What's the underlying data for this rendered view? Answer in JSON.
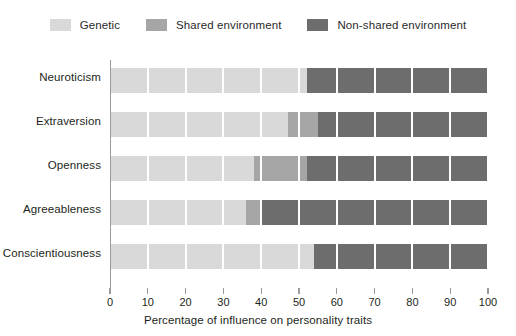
{
  "chart_data": {
    "type": "bar",
    "orientation": "horizontal",
    "stacked": true,
    "title": "",
    "subtitle": "",
    "xlabel": "Percentage of influence on personality traits",
    "ylabel": "",
    "xlim": [
      0,
      100
    ],
    "xticks": [
      0,
      10,
      20,
      30,
      40,
      50,
      60,
      70,
      80,
      90,
      100
    ],
    "xticklabels": [
      "0",
      "10",
      "20",
      "30",
      "40",
      "50",
      "60",
      "70",
      "80",
      "90",
      "100"
    ],
    "grid": "vertical-white-overlay",
    "legend_position": "top-center",
    "categories": [
      "Neuroticism",
      "Extraversion",
      "Openness",
      "Agreeableness",
      "Conscientiousness"
    ],
    "series": [
      {
        "name": "Genetic",
        "color": "#d9d9d9",
        "values": [
          52,
          47,
          38,
          36,
          54
        ]
      },
      {
        "name": "Shared environment",
        "color": "#a6a6a6",
        "values": [
          0,
          8,
          14,
          4,
          0
        ]
      },
      {
        "name": "Non-shared environment",
        "color": "#6d6d6d",
        "values": [
          48,
          45,
          48,
          60,
          46
        ]
      }
    ]
  },
  "legend": {
    "items": [
      {
        "label": "Genetic",
        "color": "#d9d9d9"
      },
      {
        "label": "Shared environment",
        "color": "#a6a6a6"
      },
      {
        "label": "Non-shared environment",
        "color": "#6d6d6d"
      }
    ]
  },
  "axis": {
    "x_title": "Percentage of influence on personality traits",
    "tick_0": "0",
    "tick_10": "10",
    "tick_20": "20",
    "tick_30": "30",
    "tick_40": "40",
    "tick_50": "50",
    "tick_60": "60",
    "tick_70": "70",
    "tick_80": "80",
    "tick_90": "90",
    "tick_100": "100"
  },
  "categories": {
    "c0": "Neuroticism",
    "c1": "Extraversion",
    "c2": "Openness",
    "c3": "Agreeableness",
    "c4": "Conscientiousness"
  },
  "colors": {
    "genetic": "#d9d9d9",
    "shared": "#a6a6a6",
    "nonshared": "#6d6d6d",
    "axis": "#9a9a9a",
    "text": "#231f20",
    "background": "#ffffff"
  }
}
